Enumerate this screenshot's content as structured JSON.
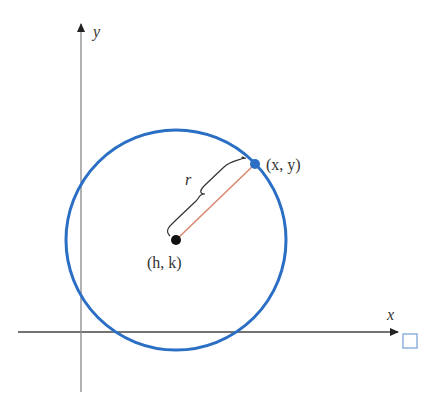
{
  "diagram": {
    "axes": {
      "x_label": "x",
      "y_label": "y"
    },
    "labels": {
      "center": "(h, k)",
      "point": "(x, y)",
      "radius": "r"
    },
    "colors": {
      "circle": "#2a6fc4",
      "radius_line": "#d9866e",
      "axis": "#444444",
      "center_point": "#111111",
      "point_on_circle": "#2a6fc4",
      "corner_box": "#7fa6d6"
    }
  }
}
